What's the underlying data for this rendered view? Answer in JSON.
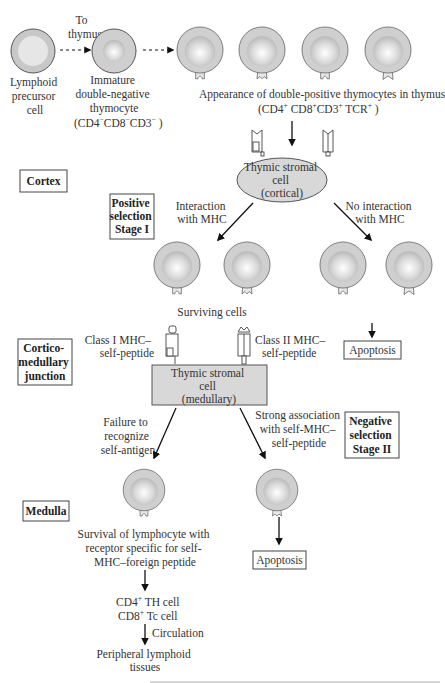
{
  "top": {
    "precursor_label": [
      "Lymphoid",
      "precursor",
      "cell"
    ],
    "to_thymus_label": [
      "To",
      "thymus"
    ],
    "immature_label": [
      "Immature",
      "double-negative",
      "thymocyte"
    ],
    "immature_markers": {
      "cd4": "CD4",
      "cd4_sign": "−",
      "cd8": "CD8",
      "cd8_sign": "−",
      "cd3": "CD3",
      "cd3_sign": "−"
    },
    "double_positive_label": "Appearance of double-positive thymocytes in thymus",
    "double_positive_markers": {
      "cd4": "CD4",
      "cd4_sign": "+",
      "cd8": "CD8",
      "cd8_sign": "+",
      "cd3": "CD3",
      "cd3_sign": "+",
      "tcr": "TCR",
      "tcr_sign": "+"
    }
  },
  "zones": {
    "cortex": "Cortex",
    "corticomedullary": [
      "Cortico-",
      "medullary",
      "junction"
    ],
    "medulla": "Medulla"
  },
  "stages": {
    "positive": [
      "Positive",
      "selection",
      "Stage I"
    ],
    "negative": [
      "Negative",
      "selection",
      "Stage II"
    ]
  },
  "cortical_stromal": [
    "Thymic stromal",
    "cell",
    "(cortical)"
  ],
  "interaction_label": [
    "Interaction",
    "with MHC"
  ],
  "no_interaction_label": [
    "No interaction",
    "with MHC"
  ],
  "surviving_label": "Surviving cells",
  "apoptosis_label": "Apoptosis",
  "class1_label": [
    "Class I MHC–",
    "self-peptide"
  ],
  "class2_label": [
    "Class II MHC–",
    "self-peptide"
  ],
  "medullary_stromal": [
    "Thymic stromal",
    "cell",
    "(medullary)"
  ],
  "failure_label": [
    "Failure to",
    "recognize",
    "self-antigen"
  ],
  "strong_label": [
    "Strong association",
    "with self-MHC–",
    "self-peptide"
  ],
  "survival_label": [
    "Survival of lymphocyte with",
    "receptor specific for self-",
    "MHC–foreign peptide"
  ],
  "th_cell": {
    "cd": "CD4",
    "sign": "+",
    "name": "TH cell"
  },
  "tc_cell": {
    "cd": "CD8",
    "sign": "+",
    "name": "Tc cell"
  },
  "circulation_label": "Circulation",
  "peripheral_label": [
    "Peripheral lymphoid",
    "tissues"
  ]
}
